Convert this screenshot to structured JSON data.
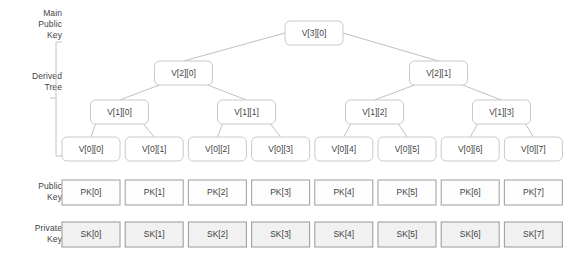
{
  "diagram": {
    "title_hidden": "",
    "side_labels": [
      {
        "name": "main-public-key",
        "lines": [
          "Main",
          "Public",
          "Key"
        ]
      },
      {
        "name": "derived-tree",
        "lines": [
          "Derived",
          "Tree"
        ]
      },
      {
        "name": "public-key",
        "lines": [
          "Public",
          "Key"
        ]
      },
      {
        "name": "private-key",
        "lines": [
          "Private",
          "Key"
        ]
      }
    ],
    "root": {
      "label": "V[3][0]"
    },
    "level2": [
      {
        "label": "V[2][0]"
      },
      {
        "label": "V[2][1]"
      }
    ],
    "level1": [
      {
        "label": "V[1][0]"
      },
      {
        "label": "V[1][1]"
      },
      {
        "label": "V[1][2]"
      },
      {
        "label": "V[1][3]"
      }
    ],
    "level0": [
      {
        "label": "V[0][0]"
      },
      {
        "label": "V[0][1]"
      },
      {
        "label": "V[0][2]"
      },
      {
        "label": "V[0][3]"
      },
      {
        "label": "V[0][4]"
      },
      {
        "label": "V[0][5]"
      },
      {
        "label": "V[0][6]"
      },
      {
        "label": "V[0][7]"
      }
    ],
    "public_keys": [
      {
        "label": "PK[0]"
      },
      {
        "label": "PK[1]"
      },
      {
        "label": "PK[2]"
      },
      {
        "label": "PK[3]"
      },
      {
        "label": "PK[4]"
      },
      {
        "label": "PK[5]"
      },
      {
        "label": "PK[6]"
      },
      {
        "label": "PK[7]"
      }
    ],
    "private_keys": [
      {
        "label": "SK[0]"
      },
      {
        "label": "SK[1]"
      },
      {
        "label": "SK[2]"
      },
      {
        "label": "SK[3]"
      },
      {
        "label": "SK[4]"
      },
      {
        "label": "SK[5]"
      },
      {
        "label": "SK[6]"
      },
      {
        "label": "SK[7]"
      }
    ],
    "colors": {
      "node_stroke": "#c9c9c9",
      "node_fill": "#ffffff",
      "pk_stroke": "#a6a6a6",
      "pk_fill": "#fdfdfd",
      "sk_stroke": "#a0a0a0",
      "sk_fill": "#f1f1f1",
      "edge": "#b9b9b9",
      "bracket": "#c2c2c2",
      "text": "#3f3f3f"
    }
  }
}
